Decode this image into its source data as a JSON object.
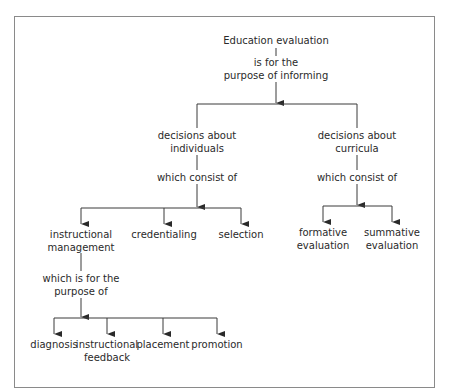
{
  "diagram": {
    "root": {
      "lines": [
        "Education evaluation"
      ]
    },
    "root_link": {
      "lines": [
        "is for the",
        "purpose of informing"
      ]
    },
    "branches": [
      {
        "label": {
          "lines": [
            "decisions about",
            "individuals"
          ]
        },
        "link": {
          "lines": [
            "which consist of"
          ]
        },
        "children": [
          {
            "lines": [
              "instructional",
              "management"
            ]
          },
          {
            "lines": [
              "credentialing"
            ]
          },
          {
            "lines": [
              "selection"
            ]
          }
        ]
      },
      {
        "label": {
          "lines": [
            "decisions about",
            "curricula"
          ]
        },
        "link": {
          "lines": [
            "which consist of"
          ]
        },
        "children": [
          {
            "lines": [
              "formative",
              "evaluation"
            ]
          },
          {
            "lines": [
              "summative",
              "evaluation"
            ]
          }
        ]
      }
    ],
    "sub_link": {
      "lines": [
        "which is for the",
        "purpose of"
      ]
    },
    "sub_children": [
      {
        "lines": [
          "diagnosis"
        ]
      },
      {
        "lines": [
          "instructional",
          "feedback"
        ]
      },
      {
        "lines": [
          "placement"
        ]
      },
      {
        "lines": [
          "promotion"
        ]
      }
    ],
    "colors": {
      "line": "#3a3a3a",
      "frame": "#8a8a8a",
      "text": "#2a2a2a"
    }
  }
}
